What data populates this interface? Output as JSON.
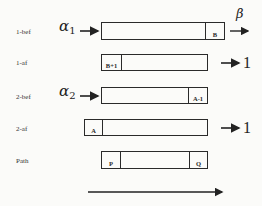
{
  "rows": [
    {
      "label": "1-bef",
      "input": "α",
      "input_sub": "1",
      "cell_right": "B",
      "output_symbol": "β"
    },
    {
      "label": "1-af",
      "cell_left": "B+1",
      "output": "1"
    },
    {
      "label": "2-bef",
      "input": "α",
      "input_sub": "2",
      "cell_right": "A-1"
    },
    {
      "label": "2-af",
      "cell_left": "A",
      "output": "1"
    },
    {
      "label": "Path",
      "cell_left": "P",
      "cell_right": "Q"
    }
  ],
  "icons": {
    "arrow": "right-arrow-icon"
  }
}
